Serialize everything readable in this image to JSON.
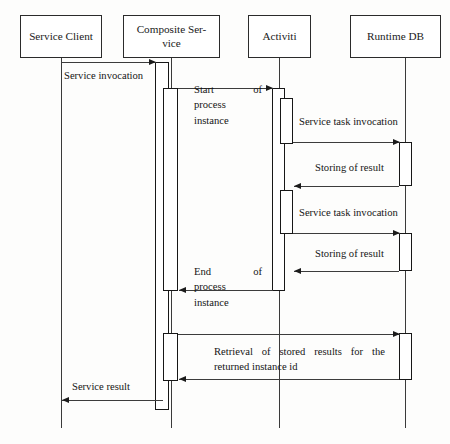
{
  "diagram": {
    "type": "sequence-diagram",
    "width": 450,
    "height": 444,
    "background_color": "#fdfdfc",
    "line_color": "#3c3c3c",
    "text_color": "#151515"
  },
  "participants": [
    {
      "id": "service-client",
      "label": "Service Client",
      "box": {
        "x": 20,
        "y": 15,
        "w": 82,
        "h": 43
      },
      "lifeline_x": 61,
      "lifeline_top": 58,
      "lifeline_bottom": 428
    },
    {
      "id": "composite-service",
      "label": "Composite Ser-\nvice",
      "box": {
        "x": 123,
        "y": 15,
        "w": 97,
        "h": 43
      },
      "lifeline_x": 171,
      "lifeline_top": 58,
      "lifeline_bottom": 428
    },
    {
      "id": "activiti",
      "label": "Activiti",
      "box": {
        "x": 248,
        "y": 15,
        "w": 63,
        "h": 43
      },
      "lifeline_x": 279,
      "lifeline_top": 58,
      "lifeline_bottom": 428
    },
    {
      "id": "runtime-db",
      "label": "Runtime DB",
      "box": {
        "x": 350,
        "y": 15,
        "w": 91,
        "h": 43
      },
      "lifeline_x": 405,
      "lifeline_top": 58,
      "lifeline_bottom": 428
    }
  ],
  "activations": [
    {
      "id": "composite-outer",
      "participant": "composite-service",
      "x": 155,
      "y": 62,
      "w": 14,
      "h": 348
    },
    {
      "id": "composite-inner-1",
      "participant": "composite-service",
      "x": 163,
      "y": 88,
      "w": 15,
      "h": 203
    },
    {
      "id": "composite-inner-2",
      "participant": "composite-service",
      "x": 163,
      "y": 333,
      "w": 15,
      "h": 48
    },
    {
      "id": "activiti-outer",
      "participant": "activiti",
      "x": 272,
      "y": 88,
      "w": 13,
      "h": 203
    },
    {
      "id": "activiti-inner-1",
      "participant": "activiti",
      "x": 280,
      "y": 98,
      "w": 13,
      "h": 46
    },
    {
      "id": "activiti-inner-2",
      "participant": "activiti",
      "x": 280,
      "y": 190,
      "w": 13,
      "h": 44
    },
    {
      "id": "runtimedb-bar-1",
      "participant": "runtime-db",
      "x": 399,
      "y": 142,
      "w": 13,
      "h": 44
    },
    {
      "id": "runtimedb-bar-2",
      "participant": "runtime-db",
      "x": 399,
      "y": 233,
      "w": 13,
      "h": 38
    },
    {
      "id": "runtimedb-bar-3",
      "participant": "runtime-db",
      "x": 399,
      "y": 333,
      "w": 13,
      "h": 47
    }
  ],
  "messages": [
    {
      "id": "service-invocation",
      "label": "Service invocation",
      "from": "service-client",
      "to": "composite-service",
      "direction": "right",
      "y": 62,
      "x1": 62,
      "x2": 156,
      "label_box": {
        "x": 64,
        "y": 68,
        "w": 105
      },
      "label_style": "plain"
    },
    {
      "id": "start-of-process-instance",
      "label": "Start of process instance",
      "label_lines": [
        "Start of",
        "process",
        "instance"
      ],
      "from": "composite-service",
      "to": "activiti",
      "direction": "right",
      "y": 88,
      "x1": 178,
      "x2": 273,
      "label_box": {
        "x": 194,
        "y": 82,
        "w": 68
      },
      "label_style": "justified-first-line"
    },
    {
      "id": "service-task-invocation-1",
      "label": "Service task invocation",
      "from": "activiti",
      "to": "runtime-db",
      "direction": "right",
      "y": 142,
      "x1": 293,
      "x2": 400,
      "label_box": {
        "x": 299,
        "y": 114,
        "w": 128
      },
      "label_style": "plain"
    },
    {
      "id": "storing-of-result-1",
      "label": "Storing of result",
      "from": "runtime-db",
      "to": "activiti",
      "direction": "left",
      "y": 186,
      "x1": 294,
      "x2": 399,
      "label_box": {
        "x": 315,
        "y": 160,
        "w": 96
      },
      "label_style": "plain"
    },
    {
      "id": "service-task-invocation-2",
      "label": "Service task invocation",
      "from": "activiti",
      "to": "runtime-db",
      "direction": "right",
      "y": 233,
      "x1": 293,
      "x2": 400,
      "label_box": {
        "x": 299,
        "y": 205,
        "w": 128
      },
      "label_style": "plain"
    },
    {
      "id": "storing-of-result-2",
      "label": "Storing of result",
      "from": "runtime-db",
      "to": "activiti",
      "direction": "left",
      "y": 271,
      "x1": 294,
      "x2": 399,
      "label_box": {
        "x": 315,
        "y": 246,
        "w": 96
      },
      "label_style": "plain"
    },
    {
      "id": "end-of-process-instance",
      "label": "End of process instance",
      "label_lines": [
        "End of",
        "process",
        "instance"
      ],
      "from": "activiti",
      "to": "composite-service",
      "direction": "left",
      "y": 290,
      "x1": 179,
      "x2": 273,
      "label_box": {
        "x": 194,
        "y": 264,
        "w": 68
      },
      "label_style": "justified-first-line"
    },
    {
      "id": "retrieval-request",
      "label": "Retrieval of stored results for the returned instance id",
      "label_lines": [
        "Retrieval of stored results for the",
        "returned instance id"
      ],
      "from": "composite-service",
      "to": "runtime-db",
      "direction": "right",
      "y": 334,
      "x1": 178,
      "x2": 400,
      "label_box": {
        "x": 214,
        "y": 344,
        "w": 171
      },
      "label_style": "justified-block"
    },
    {
      "id": "retrieval-response",
      "label": "",
      "from": "runtime-db",
      "to": "composite-service",
      "direction": "left",
      "y": 379,
      "x1": 179,
      "x2": 399,
      "label_box": null,
      "label_style": "none"
    },
    {
      "id": "service-result",
      "label": "Service result",
      "from": "composite-service",
      "to": "service-client",
      "direction": "left",
      "y": 400,
      "x1": 62,
      "x2": 163,
      "label_box": {
        "x": 72,
        "y": 379,
        "w": 90
      },
      "label_style": "plain"
    }
  ]
}
